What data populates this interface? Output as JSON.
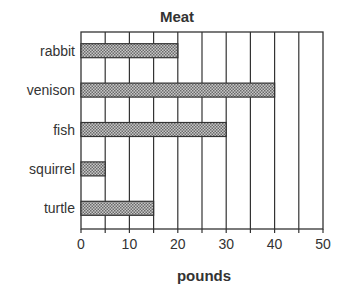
{
  "chart_data": {
    "type": "bar",
    "orientation": "horizontal",
    "title": "Meat",
    "xlabel": "pounds",
    "ylabel": "",
    "categories": [
      "rabbit",
      "venison",
      "fish",
      "squirrel",
      "turtle"
    ],
    "values": [
      20,
      40,
      30,
      5,
      15
    ],
    "xlim": [
      0,
      50
    ],
    "xticks": [
      0,
      10,
      20,
      30,
      40,
      50
    ],
    "grid": {
      "vertical": true,
      "step": 5
    },
    "legend": null
  },
  "colors": {
    "bar_fill": "#9a9a9a",
    "stroke": "#333333",
    "background": "#ffffff"
  }
}
